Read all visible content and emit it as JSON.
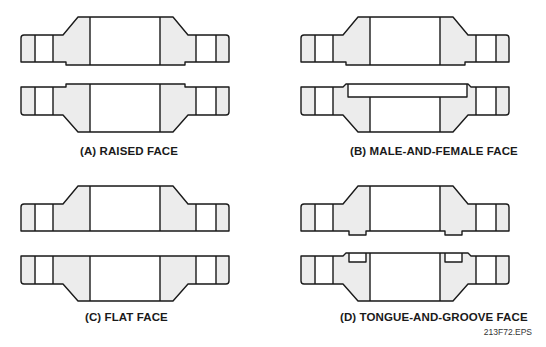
{
  "figure": {
    "panels": [
      {
        "id": "A",
        "caption": "(A) RAISED FACE"
      },
      {
        "id": "B",
        "caption": "(B) MALE-AND-FEMALE FACE"
      },
      {
        "id": "C",
        "caption": "(C) FLAT FACE"
      },
      {
        "id": "D",
        "caption": "(D) TONGUE-AND-GROOVE FACE"
      }
    ],
    "file_id": "213F72.EPS"
  },
  "colors": {
    "line": "#1a1a1a",
    "shading": "#ececec",
    "background": "#ffffff"
  }
}
